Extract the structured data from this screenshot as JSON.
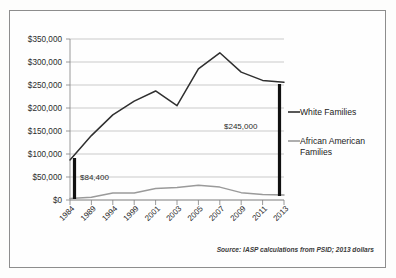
{
  "figure": {
    "name": "wealth-gap-line-chart",
    "source_note": "Source: IASP calculations from PSID; 2013 dollars"
  },
  "legend": {
    "position": "right",
    "items": [
      {
        "label": "White Families",
        "color": "#2f2f2f"
      },
      {
        "label": "African American",
        "label2": "Families",
        "color": "#9a9a9a"
      }
    ]
  },
  "annotations": [
    {
      "name": "gap-1984",
      "text": "$84,400",
      "year": "1984",
      "value": 84400
    },
    {
      "name": "gap-2013",
      "text": "$245,000",
      "year": "2013",
      "value": 245000
    }
  ],
  "chart_data": {
    "type": "line",
    "title": "",
    "subtitle": "",
    "xlabel": "",
    "ylabel": "",
    "grid": true,
    "legend_position": "right",
    "categories": [
      "1984",
      "1989",
      "1994",
      "1999",
      "2001",
      "2003",
      "2005",
      "2007",
      "2009",
      "2011",
      "2013"
    ],
    "ylim": [
      0,
      350000
    ],
    "yticks": [
      0,
      50000,
      100000,
      150000,
      200000,
      250000,
      300000,
      350000
    ],
    "ytick_labels": [
      "$0",
      "$50,000",
      "$100,000",
      "$150,000",
      "$200,000",
      "$250,000",
      "$300,000",
      "$350,000"
    ],
    "series": [
      {
        "name": "White Families",
        "color": "#2f2f2f",
        "values": [
          87000,
          140000,
          185000,
          215000,
          237000,
          205000,
          285000,
          320000,
          278000,
          260000,
          256000
        ]
      },
      {
        "name": "African American Families",
        "color": "#9a9a9a",
        "values": [
          3000,
          6000,
          15000,
          15000,
          25000,
          27000,
          32000,
          28000,
          16000,
          12000,
          11000
        ]
      }
    ]
  }
}
